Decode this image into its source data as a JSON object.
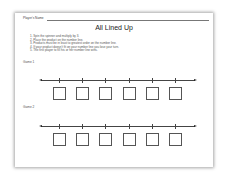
{
  "worksheet": {
    "name_label": "Player's Name",
    "title": "All Lined Up",
    "instructions": [
      "1.  Spin the spinner and multiply by 3.",
      "2.  Place the product on the number line.",
      "3.  Products must be in least to greatest order on the number line.",
      "4.  If your product doesn't fit on your number line you lose your turn.",
      "5.  The first player to fill his or her number line wins."
    ],
    "games": [
      {
        "label": "Game 1",
        "boxes": [
          "",
          "",
          "",
          "",
          "",
          ""
        ]
      },
      {
        "label": "Game 2",
        "boxes": [
          "",
          "",
          "",
          "",
          "",
          ""
        ]
      }
    ]
  }
}
